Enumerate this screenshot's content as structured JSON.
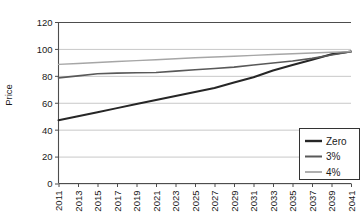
{
  "chart_data": {
    "type": "line",
    "title": "",
    "xlabel": "",
    "ylabel": "Price",
    "ylim": [
      0,
      120
    ],
    "ytick_values": [
      0,
      20,
      40,
      60,
      80,
      100,
      120
    ],
    "ytick_labels": [
      "0",
      "20",
      "40",
      "60",
      "80",
      "100",
      "120"
    ],
    "grid": true,
    "grid_axis": "y",
    "legend_position": "bottom-right",
    "x": [
      2011,
      2013,
      2015,
      2017,
      2019,
      2021,
      2023,
      2025,
      2027,
      2029,
      2031,
      2033,
      2035,
      2037,
      2039,
      2041
    ],
    "categories": [
      "2011",
      "2013",
      "2015",
      "2017",
      "2019",
      "2021",
      "2023",
      "2025",
      "2027",
      "2029",
      "2031",
      "2033",
      "2035",
      "2037",
      "2039",
      "2041"
    ],
    "series": [
      {
        "name": "Zero",
        "color": "#262626",
        "width": 2.0,
        "values": [
          47,
          50,
          53,
          56,
          59,
          62,
          65,
          68,
          71,
          75,
          79,
          84,
          88,
          92,
          96,
          98
        ]
      },
      {
        "name": "3%",
        "color": "#595959",
        "width": 1.6,
        "values": [
          78.5,
          80,
          81.5,
          82,
          82.3,
          82.5,
          83.5,
          84.5,
          85.5,
          86.5,
          88,
          89.5,
          91,
          93,
          95.5,
          98
        ]
      },
      {
        "name": "4%",
        "color": "#a6a6a6",
        "width": 1.4,
        "values": [
          88.5,
          89.2,
          89.9,
          90.6,
          91.3,
          92,
          92.7,
          93.4,
          94,
          94.6,
          95.2,
          95.8,
          96.4,
          97,
          97.5,
          98
        ]
      }
    ]
  },
  "legend": {
    "entries": [
      {
        "label": "Zero"
      },
      {
        "label": "3%"
      },
      {
        "label": "4%"
      }
    ]
  },
  "axes": {
    "y_title": "Price"
  },
  "colors": {
    "gridline": "#c8c8c8",
    "axis": "#4d4d4d",
    "text": "#1a1a1a",
    "background": "#ffffff",
    "legend_border": "#333333"
  }
}
